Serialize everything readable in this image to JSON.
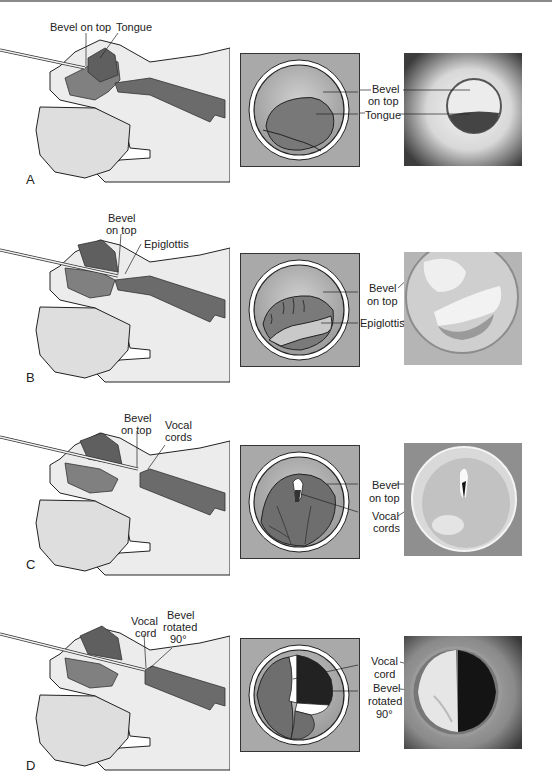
{
  "figure": {
    "panels": [
      {
        "letter": "A",
        "sideview_labels": [
          "Bevel on top",
          "Tongue"
        ],
        "view_labels": [
          {
            "line1": "Bevel",
            "line2": "on top"
          },
          {
            "line1": "Tongue",
            "line2": ""
          }
        ]
      },
      {
        "letter": "B",
        "sideview_labels": [
          "Bevel",
          "on top",
          "Epiglottis"
        ],
        "view_labels": [
          {
            "line1": "Bevel",
            "line2": "on top"
          },
          {
            "line1": "Epiglottis",
            "line2": ""
          }
        ]
      },
      {
        "letter": "C",
        "sideview_labels": [
          "Bevel",
          "on top",
          "Vocal",
          "cords"
        ],
        "view_labels": [
          {
            "line1": "Bevel",
            "line2": "on top"
          },
          {
            "line1": "Vocal",
            "line2": "cords"
          }
        ]
      },
      {
        "letter": "D",
        "sideview_labels": [
          "Vocal",
          "cord",
          "Bevel",
          "rotated",
          "90°"
        ],
        "view_labels": [
          {
            "line1": "Vocal",
            "line2": "cord"
          },
          {
            "line1": "Bevel",
            "line2": "rotated",
            "line3": "90°"
          }
        ]
      }
    ]
  },
  "colors": {
    "skin": "#ececec",
    "airway_dark": "#6b6b6b",
    "tongue": "#7a7a7a",
    "scope_bg": "#a9a9a9",
    "ring": "#ffffff",
    "outline": "#222222"
  }
}
